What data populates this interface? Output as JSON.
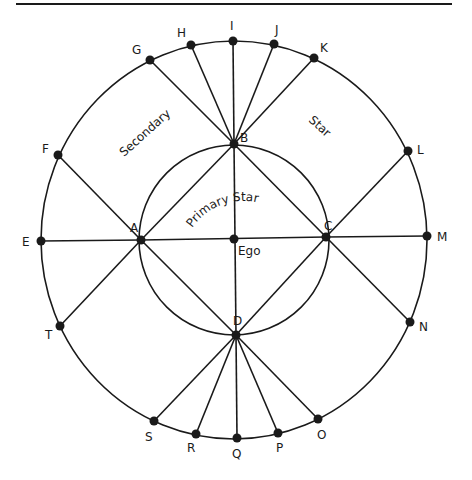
{
  "diagram": {
    "type": "star-network",
    "colors": {
      "stroke": "#1a1a1a",
      "background": "#ffffff"
    },
    "top_rule": {
      "x1": 16,
      "y1": 4,
      "x2": 452,
      "y2": 4
    },
    "outer_ellipse": {
      "cx": 234,
      "cy": 240,
      "rx": 193,
      "ry": 199
    },
    "inner_circle": {
      "cx": 234,
      "cy": 240,
      "r": 95
    },
    "region_labels": {
      "secondary": "Secondary",
      "secondary_star": "Star",
      "primary_star": "Primary Star",
      "ego": "Ego"
    },
    "inner_nodes": [
      {
        "id": "A",
        "label": "A",
        "x": 141,
        "y": 240,
        "lx": 130,
        "ly": 232
      },
      {
        "id": "B",
        "label": "B",
        "x": 234,
        "y": 144,
        "lx": 240,
        "ly": 142
      },
      {
        "id": "C",
        "label": "C",
        "x": 326,
        "y": 237,
        "lx": 324,
        "ly": 230
      },
      {
        "id": "D",
        "label": "D",
        "x": 236,
        "y": 335,
        "lx": 233,
        "ly": 325
      },
      {
        "id": "Ego",
        "label": "Ego",
        "x": 234,
        "y": 239,
        "lx": 238,
        "ly": 255
      }
    ],
    "outer_nodes": [
      {
        "id": "E",
        "label": "E",
        "x": 41,
        "y": 241,
        "lx": 22,
        "ly": 246,
        "hub": "A"
      },
      {
        "id": "F",
        "label": "F",
        "x": 58,
        "y": 155,
        "lx": 42,
        "ly": 153,
        "hub": "A"
      },
      {
        "id": "G",
        "label": "G",
        "x": 150,
        "y": 60,
        "lx": 132,
        "ly": 54,
        "hub": "B"
      },
      {
        "id": "H",
        "label": "H",
        "x": 191,
        "y": 45,
        "lx": 177,
        "ly": 37,
        "hub": "B"
      },
      {
        "id": "I",
        "label": "I",
        "x": 233,
        "y": 41,
        "lx": 230,
        "ly": 30,
        "hub": "B"
      },
      {
        "id": "J",
        "label": "J",
        "x": 274,
        "y": 44,
        "lx": 275,
        "ly": 34,
        "hub": "B"
      },
      {
        "id": "K",
        "label": "K",
        "x": 314,
        "y": 58,
        "lx": 320,
        "ly": 52,
        "hub": "B"
      },
      {
        "id": "L",
        "label": "L",
        "x": 408,
        "y": 151,
        "lx": 417,
        "ly": 154,
        "hub": "C"
      },
      {
        "id": "M",
        "label": "M",
        "x": 427,
        "y": 236,
        "lx": 437,
        "ly": 241,
        "hub": "C"
      },
      {
        "id": "N",
        "label": "N",
        "x": 410,
        "y": 322,
        "lx": 419,
        "ly": 331,
        "hub": "C"
      },
      {
        "id": "O",
        "label": "O",
        "x": 318,
        "y": 419,
        "lx": 317,
        "ly": 439,
        "hub": "D"
      },
      {
        "id": "P",
        "label": "P",
        "x": 278,
        "y": 433,
        "lx": 276,
        "ly": 452,
        "hub": "D"
      },
      {
        "id": "Q",
        "label": "Q",
        "x": 237,
        "y": 438,
        "lx": 232,
        "ly": 458,
        "hub": "D"
      },
      {
        "id": "R",
        "label": "R",
        "x": 196,
        "y": 434,
        "lx": 187,
        "ly": 452,
        "hub": "D"
      },
      {
        "id": "S",
        "label": "S",
        "x": 154,
        "y": 421,
        "lx": 145,
        "ly": 441,
        "hub": "D"
      },
      {
        "id": "T",
        "label": "T",
        "x": 60,
        "y": 326,
        "lx": 45,
        "ly": 339,
        "hub": "A"
      }
    ],
    "inner_edges": [
      [
        "A",
        "C"
      ],
      [
        "B",
        "D"
      ],
      [
        "A",
        "B"
      ],
      [
        "B",
        "C"
      ],
      [
        "C",
        "D"
      ],
      [
        "D",
        "A"
      ]
    ]
  }
}
